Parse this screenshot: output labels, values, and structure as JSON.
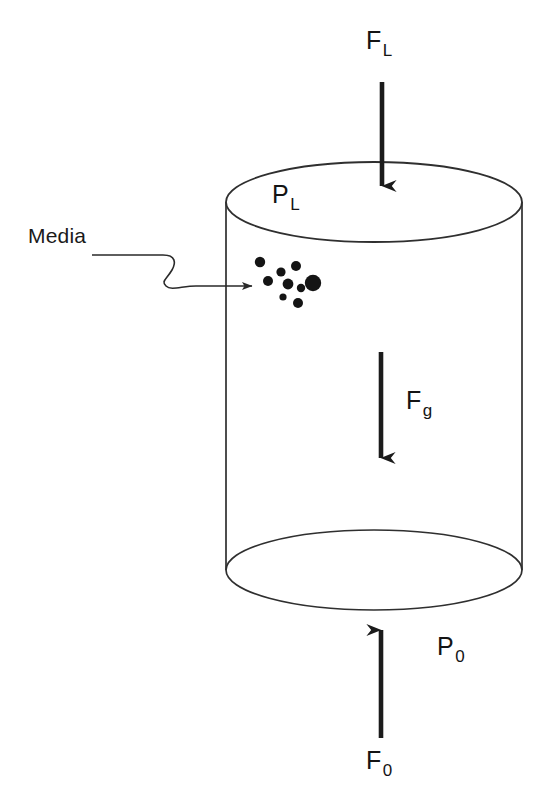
{
  "figure": {
    "type": "schematic-diagram",
    "background_color": "#ffffff",
    "line_color": "#2a2a2a",
    "fill_color": "#ffffff",
    "particle_color": "#141414",
    "text_color": "#141414"
  },
  "labels": {
    "force_top": {
      "base": "F",
      "sub": "L",
      "full": "FL"
    },
    "pressure_top": {
      "base": "P",
      "sub": "L",
      "full": "PL"
    },
    "force_gravity": {
      "base": "F",
      "sub": "g",
      "full": "Fg"
    },
    "pressure_bottom": {
      "base": "P",
      "sub": "0",
      "full": "P0"
    },
    "force_bottom": {
      "base": "F",
      "sub": "0",
      "full": "F0"
    },
    "media": "Media"
  },
  "geometry": {
    "cylinder": {
      "left_x": 226,
      "right_x": 522,
      "top_ellipse_cy": 202,
      "bottom_ellipse_cy": 570,
      "ellipse_rx": 148,
      "ellipse_ry": 40
    },
    "arrows": [
      {
        "name": "force-top-arrow",
        "x": 382,
        "y_start": 82,
        "y_end": 200,
        "direction": "down"
      },
      {
        "name": "force-gravity-arrow",
        "x": 381,
        "y_start": 352,
        "y_end": 472,
        "direction": "down"
      },
      {
        "name": "force-bottom-arrow",
        "x": 381,
        "y_start": 738,
        "y_end": 616,
        "direction": "up"
      }
    ],
    "leader_line": {
      "name": "media-leader",
      "start_x": 92,
      "start_y": 255,
      "end_x": 256,
      "end_y": 285,
      "shape": "s-curve-with-arrowhead"
    },
    "particles": [
      {
        "cx": 260,
        "cy": 262,
        "r": 5.2
      },
      {
        "cx": 268,
        "cy": 281,
        "r": 5.0
      },
      {
        "cx": 281,
        "cy": 272,
        "r": 4.6
      },
      {
        "cx": 288,
        "cy": 284,
        "r": 5.4
      },
      {
        "cx": 283,
        "cy": 297,
        "r": 3.6
      },
      {
        "cx": 296,
        "cy": 266,
        "r": 5.0
      },
      {
        "cx": 301,
        "cy": 288,
        "r": 4.2
      },
      {
        "cx": 298,
        "cy": 303,
        "r": 5.0
      },
      {
        "cx": 313,
        "cy": 283,
        "r": 8.2
      }
    ]
  }
}
